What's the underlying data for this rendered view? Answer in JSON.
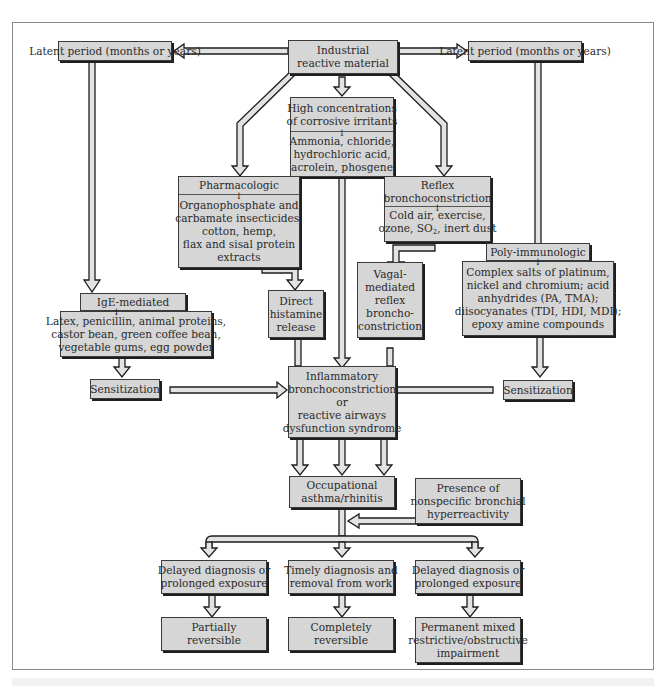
{
  "diagram": {
    "colors": {
      "box_fill": "#d6d6d6",
      "border": "#3a3a3a",
      "shadow": "#1e1e1e",
      "arrow_fill": "#e0e0e0",
      "frame": "#8a8a8a"
    },
    "nodes": {
      "latent_left": {
        "label": "Latent period (months or years)"
      },
      "industrial": {
        "lines": [
          "Industrial",
          "reactive material"
        ]
      },
      "latent_right": {
        "label": "Latent period (months or years)"
      },
      "high_conc": {
        "header": [
          "High concentrations",
          "of corrosive irritants"
        ],
        "body": [
          "Ammonia, chloride,",
          "hydrochloric acid,",
          "acrolein, phosgene"
        ]
      },
      "pharmacologic": {
        "header": "Pharmacologic",
        "body": [
          "Organophosphate and",
          "carbamate insecticides,",
          "cotton, hemp,",
          "flax and sisal protein",
          "extracts"
        ]
      },
      "reflex": {
        "header": [
          "Reflex",
          "bronchoconstriction"
        ],
        "body_line1": "Cold air, exercise,",
        "body_line2_pre": "ozone, SO",
        "body_line2_sub": "2",
        "body_line2_post": ", inert dust"
      },
      "ige": {
        "header": "IgE-mediated",
        "body": [
          "Latex, penicillin, animal proteins,",
          "castor bean, green coffee bean,",
          "vegetable gums, egg powder"
        ]
      },
      "direct_histamine": {
        "lines": [
          "Direct",
          "histamine",
          "release"
        ]
      },
      "vagal": {
        "lines": [
          "Vagal-",
          "mediated",
          "reflex",
          "broncho-",
          "constriction"
        ]
      },
      "poly_immunologic": {
        "header": "Poly-immunologic",
        "body": [
          "Complex salts of platinum,",
          "nickel and chromium; acid",
          "anhydrides (PA, TMA);",
          "diisocyanates (TDI, HDI, MDI);",
          "epoxy amine compounds"
        ]
      },
      "sensitization_left": {
        "label": "Sensitization"
      },
      "sensitization_right": {
        "label": "Sensitization"
      },
      "inflammatory": {
        "lines": [
          "Inflammatory",
          "bronchoconstriction",
          "or",
          "reactive airways",
          "dysfunction syndrome"
        ]
      },
      "occupational": {
        "lines": [
          "Occupational",
          "asthma/rhinitis"
        ]
      },
      "hyperreactivity": {
        "lines": [
          "Presence of",
          "nonspecific bronchial",
          "hyperreactivity"
        ]
      },
      "delayed_left": {
        "lines": [
          "Delayed diagnosis or",
          "prolonged exposure"
        ]
      },
      "timely": {
        "lines": [
          "Timely diagnosis and",
          "removal from work"
        ]
      },
      "delayed_right": {
        "lines": [
          "Delayed diagnosis or",
          "prolonged exposure"
        ]
      },
      "partially": {
        "lines": [
          "Partially",
          "reversible"
        ]
      },
      "completely": {
        "lines": [
          "Completely",
          "reversible"
        ]
      },
      "permanent": {
        "lines": [
          "Permanent mixed",
          "restrictive/obstructive",
          "impairment"
        ]
      }
    },
    "mini_arrow_glyph": "↓"
  }
}
